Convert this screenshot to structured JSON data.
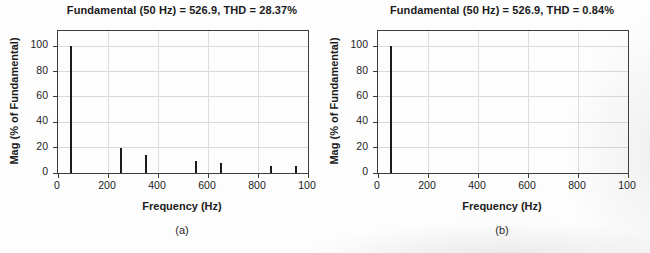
{
  "figure": {
    "background": "#fdfdfd",
    "axis_color": "#3c3c3c",
    "grid_color": "#d9d9d9",
    "bar_color": "#1b1b1b",
    "text_color": "#1a1a1a"
  },
  "chart_data": [
    {
      "type": "bar",
      "title": "Fundamental (50 Hz) = 526.9, THD = 28.37%",
      "xlabel": "Frequency (Hz)",
      "ylabel": "Mag (% of Fundamental)",
      "caption": "(a)",
      "x": [
        50,
        250,
        350,
        550,
        650,
        850,
        950
      ],
      "values": [
        100,
        20,
        14.3,
        9.1,
        7.7,
        5.9,
        5.3
      ],
      "xlim": [
        0,
        1000
      ],
      "ylim": [
        0,
        112
      ],
      "x_ticks": [
        0,
        200,
        400,
        600,
        800,
        1000
      ],
      "x_tick_labels": [
        "0",
        "200",
        "400",
        "600",
        "800",
        "100"
      ],
      "y_ticks": [
        0,
        20,
        40,
        60,
        80,
        100
      ],
      "y_tick_labels": [
        "0",
        "20",
        "40",
        "60",
        "80",
        "100"
      ],
      "grid": true,
      "legend": "none"
    },
    {
      "type": "bar",
      "title": "Fundamental (50 Hz) = 526.9, THD = 0.84%",
      "xlabel": "Frequency (Hz)",
      "ylabel": "Mag (% of Fundamental)",
      "caption": "(b)",
      "x": [
        50
      ],
      "values": [
        100
      ],
      "xlim": [
        0,
        1000
      ],
      "ylim": [
        0,
        112
      ],
      "x_ticks": [
        0,
        200,
        400,
        600,
        800,
        1000
      ],
      "x_tick_labels": [
        "0",
        "200",
        "400",
        "600",
        "800",
        "100"
      ],
      "y_ticks": [
        0,
        20,
        40,
        60,
        80,
        100
      ],
      "y_tick_labels": [
        "0",
        "20",
        "40",
        "60",
        "80",
        "100"
      ],
      "grid": true,
      "legend": "none"
    }
  ]
}
